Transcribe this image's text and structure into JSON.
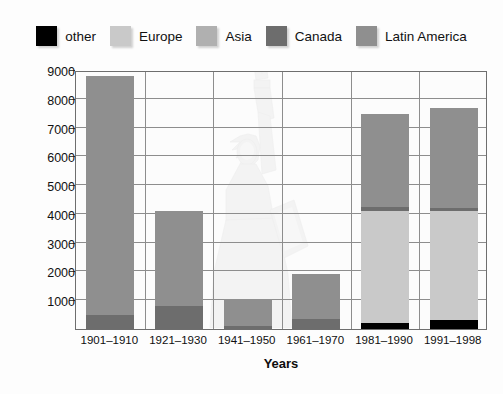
{
  "legend": {
    "items": [
      {
        "label": "other",
        "color": "#000000"
      },
      {
        "label": "Europe",
        "color": "#c9c9c9"
      },
      {
        "label": "Asia",
        "color": "#b0b0b0"
      },
      {
        "label": "Canada",
        "color": "#6d6d6d"
      },
      {
        "label": "Latin America",
        "color": "#8f8f8f"
      }
    ]
  },
  "chart_data": {
    "type": "bar",
    "subtype": "stacked",
    "title": "",
    "xlabel": "Years",
    "ylabel": "Number of immigrants (thousands)",
    "categories": [
      "1901–1910",
      "1921–1930",
      "1941–1950",
      "1961–1970",
      "1981–1990",
      "1991–1998"
    ],
    "ylim": [
      0,
      9000
    ],
    "ytick_step": 1000,
    "yticks": [
      1000,
      2000,
      3000,
      4000,
      5000,
      6000,
      7000,
      8000,
      9000
    ],
    "ytick_labels": [
      "1000",
      "2000",
      "3000",
      "4000",
      "5000",
      "6000",
      "7000",
      "8000",
      "9000"
    ],
    "grid": true,
    "legend_position": "top",
    "stack_order": [
      "other",
      "Europe",
      "Asia",
      "Canada",
      "Latin America"
    ],
    "series": [
      {
        "name": "other",
        "color": "#000000",
        "values": [
          0,
          0,
          0,
          0,
          200,
          300
        ]
      },
      {
        "name": "Europe",
        "color": "#c9c9c9",
        "values": [
          0,
          0,
          0,
          0,
          3900,
          3800
        ]
      },
      {
        "name": "Asia",
        "color": "#b0b0b0",
        "values": [
          0,
          0,
          0,
          0,
          0,
          0
        ]
      },
      {
        "name": "Canada",
        "color": "#6d6d6d",
        "values": [
          490,
          800,
          90,
          350,
          130,
          120
        ]
      },
      {
        "name": "Latin America",
        "color": "#8f8f8f",
        "values": [
          8300,
          3300,
          950,
          1550,
          3250,
          3450
        ]
      }
    ],
    "totals": [
      8790,
      4200,
      1035,
      3330,
      7400,
      7650
    ]
  }
}
